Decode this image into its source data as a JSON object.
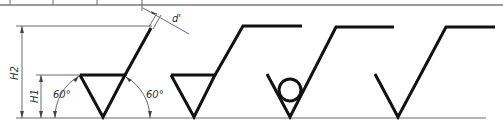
{
  "figure": {
    "colors": {
      "stroke": "#111111",
      "dimension": "#6a6a6a",
      "text": "#333333"
    },
    "dimensions": {
      "h2_label": "H2",
      "h1_label": "H1",
      "angle_left_label": "60°",
      "angle_right_label": "60°",
      "line_width_label": "d'"
    },
    "symbols": [
      {
        "name": "basic-symbol",
        "description": "Basic surface texture symbol with dimensions"
      },
      {
        "name": "material-removal-symbol",
        "description": "Material removal required (closed triangle with horizontal bar)"
      },
      {
        "name": "no-material-removal-symbol",
        "description": "Material removal prohibited (circle in V)"
      },
      {
        "name": "extended-symbol",
        "description": "Basic symbol with horizontal extension"
      }
    ]
  }
}
